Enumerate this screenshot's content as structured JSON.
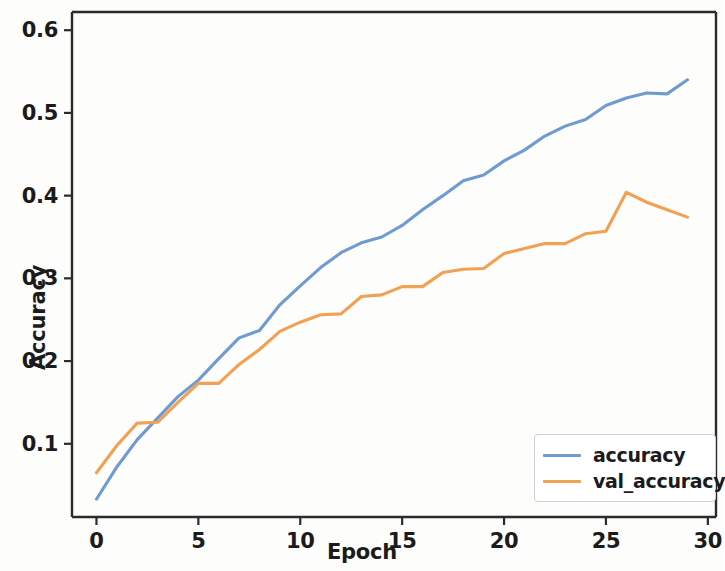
{
  "chart_data": {
    "type": "line",
    "title": "",
    "xlabel": "Epoch",
    "ylabel": "Accuracy",
    "xlim": [
      -1.2,
      30.4
    ],
    "ylim": [
      0.0115,
      0.622
    ],
    "xticks": [
      0,
      5,
      10,
      15,
      20,
      25,
      30
    ],
    "yticks": [
      0.1,
      0.2,
      0.3,
      0.4,
      0.5,
      0.6
    ],
    "xtick_labels": [
      "0",
      "5",
      "10",
      "15",
      "20",
      "25",
      "30"
    ],
    "ytick_labels": [
      "0.1",
      "0.2",
      "0.3",
      "0.4",
      "0.5",
      "0.6"
    ],
    "grid": false,
    "legend_position": "lower right",
    "x": [
      0,
      1,
      2,
      3,
      4,
      5,
      6,
      7,
      8,
      9,
      10,
      11,
      12,
      13,
      14,
      15,
      16,
      17,
      18,
      19,
      20,
      21,
      22,
      23,
      24,
      25,
      26,
      27,
      28,
      29
    ],
    "series": [
      {
        "name": "accuracy",
        "color": "#6f9bd1",
        "values": [
          0.033,
          0.072,
          0.105,
          0.131,
          0.157,
          0.177,
          0.203,
          0.228,
          0.237,
          0.268,
          0.291,
          0.313,
          0.331,
          0.343,
          0.35,
          0.364,
          0.383,
          0.4,
          0.418,
          0.425,
          0.442,
          0.455,
          0.472,
          0.484,
          0.492,
          0.509,
          0.518,
          0.524,
          0.523,
          0.54
        ]
      },
      {
        "name": "val_accuracy",
        "color": "#f2a154",
        "values": [
          0.065,
          0.098,
          0.125,
          0.126,
          0.15,
          0.173,
          0.173,
          0.196,
          0.214,
          0.236,
          0.247,
          0.256,
          0.257,
          0.278,
          0.28,
          0.29,
          0.29,
          0.307,
          0.311,
          0.312,
          0.33,
          0.336,
          0.342,
          0.342,
          0.354,
          0.357,
          0.404,
          0.392,
          0.383,
          0.374
        ]
      }
    ],
    "legend_entries": [
      {
        "label": "accuracy",
        "color": "#6f9bd1"
      },
      {
        "label": "val_accuracy",
        "color": "#f2a154"
      }
    ],
    "axis_color": "#2b2b2b",
    "background": "#fdfdfc"
  }
}
